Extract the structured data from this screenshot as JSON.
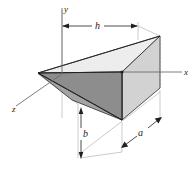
{
  "figure": {
    "axes": {
      "x_label": "x",
      "y_label": "y",
      "z_label": "z"
    },
    "dimensions": {
      "h_label": "h",
      "a_label": "a",
      "b_label": "b"
    },
    "colors": {
      "background": "#ffffff",
      "face_front_dark": "#8f8f8f",
      "face_front_mid": "#a6a6a6",
      "face_right_light": "#d4d4d4",
      "face_top_pale": "#ebebeb",
      "outline": "#1a1a1a",
      "thin_guide": "#9a9a9a",
      "text": "#1a1a1a"
    },
    "geometry": {
      "origin": {
        "x": 62,
        "y": 74
      },
      "apex_left": {
        "x": 38,
        "y": 73
      },
      "top_right": {
        "x": 160,
        "y": 36
      },
      "bottom_front": {
        "x": 122,
        "y": 120
      },
      "mid_right": {
        "x": 122,
        "y": 72
      },
      "back_right": {
        "x": 160,
        "y": 88
      }
    }
  }
}
